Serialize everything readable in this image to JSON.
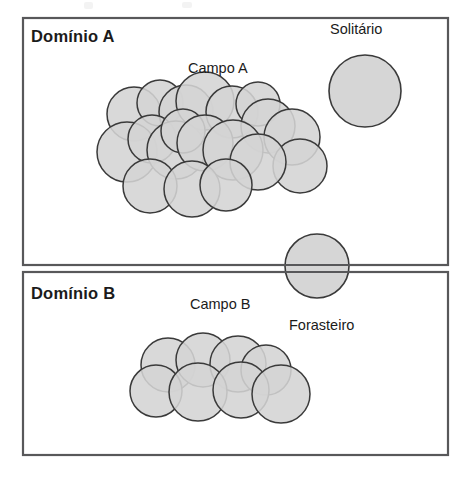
{
  "figure": {
    "type": "venn-cluster-diagram",
    "background_color": "#ffffff",
    "frame_color": "#58585a",
    "blob_fill_color": "#d4d4d4",
    "blob_stroke_color": "#3a3a3a"
  },
  "panels": [
    {
      "id": "domain-a",
      "title": "Domínio A",
      "rect": {
        "x": 23,
        "y": 18,
        "w": 425,
        "h": 247
      }
    },
    {
      "id": "domain-b",
      "title": "Domínio B",
      "rect": {
        "x": 23,
        "y": 272,
        "w": 425,
        "h": 183
      }
    }
  ],
  "labels": {
    "domain_a": "Domínio A",
    "domain_b": "Domínio B",
    "campo_a": "Campo A",
    "campo_b": "Campo B",
    "solitario": "Solitário",
    "forasteiro": "Forasteiro"
  },
  "chart_data": {
    "type": "scatter",
    "title": "",
    "clusters": [
      {
        "name": "Campo A",
        "panel": "domain-a",
        "circle_count": 19,
        "circles": [
          {
            "cx": 134,
            "cy": 114,
            "r": 27
          },
          {
            "cx": 160,
            "cy": 103,
            "r": 23
          },
          {
            "cx": 186,
            "cy": 112,
            "r": 27
          },
          {
            "cx": 205,
            "cy": 101,
            "r": 29
          },
          {
            "cx": 232,
            "cy": 112,
            "r": 26
          },
          {
            "cx": 258,
            "cy": 104,
            "r": 22
          },
          {
            "cx": 268,
            "cy": 126,
            "r": 27
          },
          {
            "cx": 292,
            "cy": 137,
            "r": 28
          },
          {
            "cx": 300,
            "cy": 166,
            "r": 27
          },
          {
            "cx": 127,
            "cy": 152,
            "r": 30
          },
          {
            "cx": 152,
            "cy": 139,
            "r": 24
          },
          {
            "cx": 176,
            "cy": 150,
            "r": 29
          },
          {
            "cx": 183,
            "cy": 131,
            "r": 22
          },
          {
            "cx": 205,
            "cy": 143,
            "r": 28
          },
          {
            "cx": 233,
            "cy": 150,
            "r": 30
          },
          {
            "cx": 258,
            "cy": 162,
            "r": 28
          },
          {
            "cx": 150,
            "cy": 186,
            "r": 27
          },
          {
            "cx": 192,
            "cy": 189,
            "r": 28
          },
          {
            "cx": 226,
            "cy": 185,
            "r": 26
          }
        ]
      },
      {
        "name": "Campo B",
        "panel": "domain-b",
        "circle_count": 8,
        "circles": [
          {
            "cx": 168,
            "cy": 365,
            "r": 27
          },
          {
            "cx": 203,
            "cy": 360,
            "r": 27
          },
          {
            "cx": 238,
            "cy": 364,
            "r": 28
          },
          {
            "cx": 266,
            "cy": 370,
            "r": 25
          },
          {
            "cx": 156,
            "cy": 391,
            "r": 26
          },
          {
            "cx": 198,
            "cy": 392,
            "r": 29
          },
          {
            "cx": 241,
            "cy": 390,
            "r": 28
          },
          {
            "cx": 281,
            "cy": 394,
            "r": 29
          }
        ]
      }
    ],
    "outliers": [
      {
        "name": "Solitário",
        "panel": "domain-a",
        "cx": 365,
        "cy": 91,
        "r": 36,
        "description": "isolated circle fully inside Domínio A"
      },
      {
        "name": "Forasteiro",
        "panel": "boundary",
        "cx": 317,
        "cy": 266,
        "r": 32,
        "description": "circle straddling the boundary between Domínio A and Domínio B"
      }
    ]
  }
}
